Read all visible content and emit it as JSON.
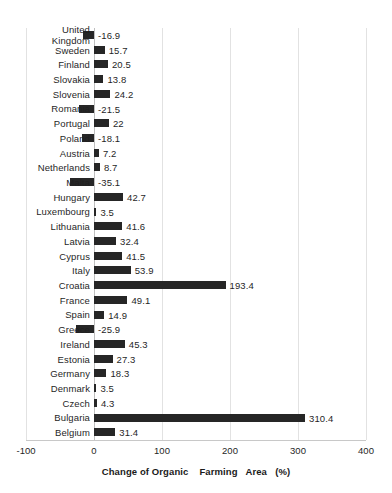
{
  "chart_data": {
    "type": "bar",
    "orientation": "horizontal",
    "title": "",
    "xlabel": "Change of Organic    Farming   Area   (%)",
    "ylabel": "",
    "xlim": [
      -100,
      400
    ],
    "xticks": [
      -100,
      0,
      100,
      200,
      300,
      400
    ],
    "xtick_labels": [
      "-100",
      "0",
      "100",
      "200",
      "300",
      "400"
    ],
    "grid": true,
    "legend": false,
    "bar_color": "#262626",
    "categories": [
      "United Kingdom",
      "Sweden",
      "Finland",
      "Slovakia",
      "Slovenia",
      "Romania",
      "Portugal",
      "Poland",
      "Austria",
      "Netherlands",
      "Malta",
      "Hungary",
      "Luxembourg",
      "Lithuania",
      "Latvia",
      "Cyprus",
      "Italy",
      "Croatia",
      "France",
      "Spain",
      "Greece",
      "Ireland",
      "Estonia",
      "Germany",
      "Denmark",
      "Czech",
      "Bulgaria",
      "Belgium"
    ],
    "values": [
      -16.9,
      15.7,
      20.5,
      13.8,
      24.2,
      -21.5,
      22,
      -18.1,
      7.2,
      8.7,
      -35.1,
      42.7,
      3.5,
      41.6,
      32.4,
      41.5,
      53.9,
      193.4,
      49.1,
      14.9,
      -25.9,
      45.3,
      27.3,
      18.3,
      3.5,
      4.3,
      310.4,
      31.4
    ],
    "value_labels": [
      "-16.9",
      "15.7",
      "20.5",
      "13.8",
      "24.2",
      "-21.5",
      "22",
      "-18.1",
      "7.2",
      "8.7",
      "-35.1",
      "42.7",
      "3.5",
      "41.6",
      "32.4",
      "41.5",
      "53.9",
      "193.4",
      "49.1",
      "14.9",
      "-25.9",
      "45.3",
      "27.3",
      "18.3",
      "3.5",
      "4.3",
      "310.4",
      "31.4"
    ]
  }
}
